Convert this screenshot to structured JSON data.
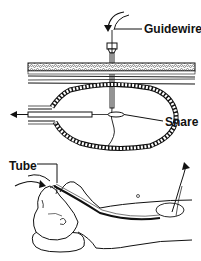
{
  "figure": {
    "type": "medical-procedure-illustration",
    "labels": {
      "guidewire": "Guidewire",
      "snare": "Snare",
      "tube": "Tube"
    },
    "colors": {
      "ink": "#111111",
      "background": "#ffffff",
      "tissue_fill": "#e8e8e8"
    },
    "panels": [
      {
        "name": "top-panel",
        "content": "cross-section of abdominal wall and stomach with needle, guidewire and snare"
      },
      {
        "name": "bottom-panel",
        "content": "patient lying supine with tube passed through mouth into stomach"
      }
    ]
  }
}
